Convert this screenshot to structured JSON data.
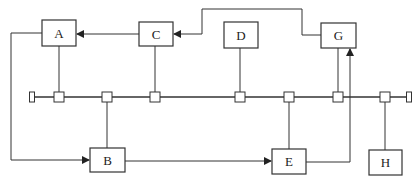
{
  "diagram": {
    "type": "bus-topology network",
    "nodes": [
      {
        "id": "A",
        "label": "A",
        "x": 42,
        "y": 20,
        "w": 34,
        "h": 26,
        "tap_x": 59,
        "side": "top"
      },
      {
        "id": "C",
        "label": "C",
        "x": 139,
        "y": 22,
        "w": 34,
        "h": 24,
        "tap_x": 155,
        "side": "top"
      },
      {
        "id": "D",
        "label": "D",
        "x": 224,
        "y": 22,
        "w": 34,
        "h": 26,
        "tap_x": 240,
        "side": "top"
      },
      {
        "id": "G",
        "label": "G",
        "x": 321,
        "y": 23,
        "w": 35,
        "h": 25,
        "tap_x": 338,
        "side": "top"
      },
      {
        "id": "B",
        "label": "B",
        "x": 90,
        "y": 148,
        "w": 35,
        "h": 24,
        "tap_x": 107,
        "side": "bottom"
      },
      {
        "id": "E",
        "label": "E",
        "x": 272,
        "y": 149,
        "w": 34,
        "h": 25,
        "tap_x": 289,
        "side": "bottom"
      },
      {
        "id": "H",
        "label": "H",
        "x": 369,
        "y": 150,
        "w": 33,
        "h": 25,
        "tap_x": 385,
        "side": "bottom"
      }
    ],
    "bus": {
      "y": 97,
      "x_start": 32,
      "x_end": 409,
      "taps": [
        59,
        107,
        155,
        240,
        289,
        338,
        385
      ]
    },
    "arrows": [
      {
        "from": "C",
        "to": "A",
        "description": "C → A"
      },
      {
        "from": "G",
        "to": "C",
        "description": "G → C via top route"
      },
      {
        "from": "A",
        "to": "B",
        "description": "A → B via left route"
      },
      {
        "from": "B",
        "to": "E",
        "description": "B → E"
      },
      {
        "from": "E",
        "to": "G",
        "description": "E → G via right route"
      }
    ],
    "colors": {
      "line": "#333333",
      "box_border": "#333333",
      "background": "#ffffff"
    }
  }
}
